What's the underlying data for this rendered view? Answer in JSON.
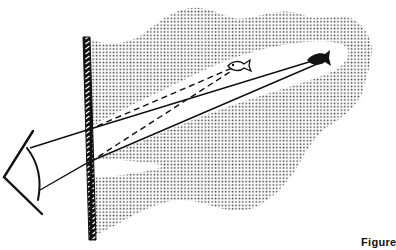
{
  "figure": {
    "caption": "Figure",
    "colors": {
      "ink": "#111111",
      "background": "#ffffff",
      "stipple": "#3a3a3a"
    },
    "elements": {
      "eye": "eye-icon",
      "wall": "hatched-wall",
      "real_fish": "fish-icon-solid",
      "apparent_fish": "fish-icon-outline",
      "water": "stippled-water-region",
      "clear_channel": "clear-viewing-channel",
      "solid_rays": 2,
      "dashed_rays": 2
    }
  }
}
